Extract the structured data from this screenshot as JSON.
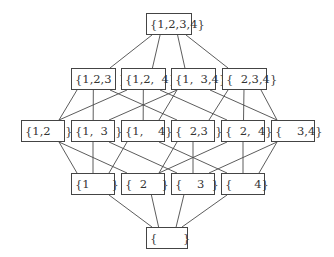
{
  "diagram": {
    "type": "hasse-diagram",
    "nodes": [
      {
        "id": "1234",
        "label": "{1,2,3,4}",
        "level": 4
      },
      {
        "id": "123",
        "label": "{1,2,3  }",
        "level": 3
      },
      {
        "id": "124",
        "label": "{1,2,  4}",
        "level": 3
      },
      {
        "id": "134",
        "label": "{1,  3,4}",
        "level": 3
      },
      {
        "id": "234",
        "label": "{  2,3,4}",
        "level": 3
      },
      {
        "id": "12",
        "label": "{1,2    }",
        "level": 2
      },
      {
        "id": "13",
        "label": "{1,  3  }",
        "level": 2
      },
      {
        "id": "14",
        "label": "{1,    4}",
        "level": 2
      },
      {
        "id": "23",
        "label": "{  2,3  }",
        "level": 2
      },
      {
        "id": "24",
        "label": "{  2,  4}",
        "level": 2
      },
      {
        "id": "34",
        "label": "{    3,4}",
        "level": 2
      },
      {
        "id": "1",
        "label": "{1      }",
        "level": 1
      },
      {
        "id": "2",
        "label": "{  2    }",
        "level": 1
      },
      {
        "id": "3",
        "label": "{    3  }",
        "level": 1
      },
      {
        "id": "4",
        "label": "{      4}",
        "level": 1
      },
      {
        "id": "empty",
        "label": "{       }",
        "level": 0
      }
    ],
    "edges": [
      [
        "1234",
        "123"
      ],
      [
        "1234",
        "124"
      ],
      [
        "1234",
        "134"
      ],
      [
        "1234",
        "234"
      ],
      [
        "123",
        "12"
      ],
      [
        "123",
        "13"
      ],
      [
        "123",
        "23"
      ],
      [
        "124",
        "12"
      ],
      [
        "124",
        "14"
      ],
      [
        "124",
        "24"
      ],
      [
        "134",
        "13"
      ],
      [
        "134",
        "14"
      ],
      [
        "134",
        "34"
      ],
      [
        "234",
        "23"
      ],
      [
        "234",
        "24"
      ],
      [
        "234",
        "34"
      ],
      [
        "12",
        "1"
      ],
      [
        "12",
        "2"
      ],
      [
        "13",
        "1"
      ],
      [
        "13",
        "3"
      ],
      [
        "14",
        "1"
      ],
      [
        "14",
        "4"
      ],
      [
        "23",
        "2"
      ],
      [
        "23",
        "3"
      ],
      [
        "24",
        "2"
      ],
      [
        "24",
        "4"
      ],
      [
        "34",
        "3"
      ],
      [
        "34",
        "4"
      ],
      [
        "1",
        "empty"
      ],
      [
        "2",
        "empty"
      ],
      [
        "3",
        "empty"
      ],
      [
        "4",
        "empty"
      ]
    ],
    "colors": {
      "line": "#4a4a4a",
      "box_border": "#444444",
      "text": "#333333",
      "background": "#ffffff"
    }
  }
}
